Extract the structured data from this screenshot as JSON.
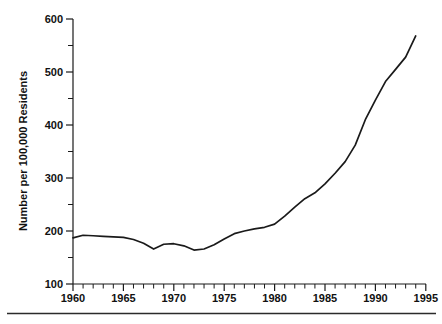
{
  "chart_data": {
    "type": "line",
    "title": "",
    "subtitle": "",
    "xlabel": "",
    "ylabel": "Number per 100,000 Residents",
    "xlim": [
      1960,
      1995
    ],
    "ylim": [
      100,
      600
    ],
    "grid": false,
    "legend": null,
    "x_tick_labels": [
      "1960",
      "1965",
      "1970",
      "1975",
      "1980",
      "1985",
      "1990",
      "1995"
    ],
    "x_major_ticks": [
      1960,
      1965,
      1970,
      1975,
      1980,
      1985,
      1990,
      1995
    ],
    "x_minor_tick_interval": 1,
    "y_tick_labels": [
      "100",
      "200",
      "300",
      "400",
      "500",
      "600"
    ],
    "y_major_ticks": [
      100,
      200,
      300,
      400,
      500,
      600
    ],
    "y_minor_tick_interval": 50,
    "series": [
      {
        "name": "Incarceration rate",
        "x": [
          1960,
          1961,
          1962,
          1963,
          1964,
          1965,
          1966,
          1967,
          1968,
          1969,
          1970,
          1971,
          1972,
          1973,
          1974,
          1975,
          1976,
          1977,
          1978,
          1979,
          1980,
          1981,
          1982,
          1983,
          1984,
          1985,
          1986,
          1987,
          1988,
          1989,
          1990,
          1991,
          1992,
          1993,
          1994
        ],
        "values": [
          187,
          192,
          191,
          190,
          189,
          188,
          184,
          177,
          166,
          175,
          176,
          172,
          164,
          166,
          174,
          185,
          195,
          200,
          204,
          207,
          213,
          228,
          245,
          261,
          272,
          289,
          309,
          331,
          362,
          410,
          447,
          482,
          505,
          528,
          568
        ]
      }
    ],
    "annotations": [],
    "footer_rule": true
  },
  "axis": {
    "y_title": "Number per 100,000 Residents"
  }
}
